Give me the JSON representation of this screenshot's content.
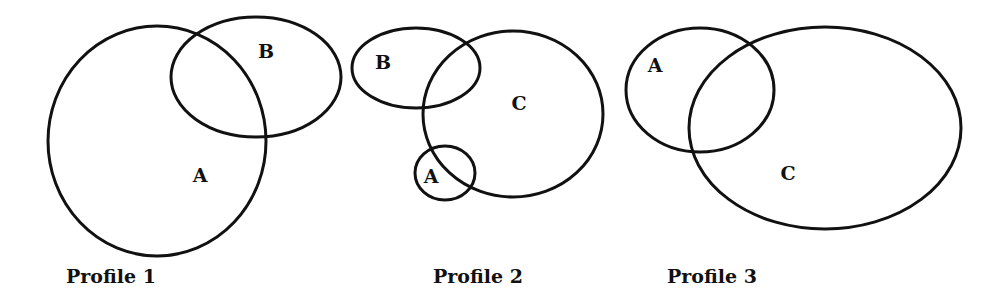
{
  "diagram": {
    "type": "euler-diagram",
    "stroke_color": "#111111",
    "background": "#ffffff",
    "profiles": [
      {
        "caption": "Profile 1",
        "caption_pos": {
          "x": 66,
          "y": 283
        },
        "sets": [
          {
            "label": "A",
            "cx": 157,
            "cy": 141,
            "rx": 109,
            "ry": 115,
            "label_pos": {
              "x": 200,
              "y": 182
            }
          },
          {
            "label": "B",
            "cx": 256,
            "cy": 77,
            "rx": 85,
            "ry": 60,
            "label_pos": {
              "x": 266,
              "y": 58
            }
          }
        ]
      },
      {
        "caption": "Profile 2",
        "caption_pos": {
          "x": 433,
          "y": 283
        },
        "sets": [
          {
            "label": "B",
            "cx": 416,
            "cy": 68,
            "rx": 64,
            "ry": 40,
            "label_pos": {
              "x": 383,
              "y": 69
            }
          },
          {
            "label": "C",
            "cx": 513,
            "cy": 114,
            "rx": 90,
            "ry": 83,
            "label_pos": {
              "x": 519,
              "y": 110
            }
          },
          {
            "label": "A",
            "cx": 445,
            "cy": 173,
            "rx": 30,
            "ry": 27,
            "label_pos": {
              "x": 431,
              "y": 183
            }
          }
        ]
      },
      {
        "caption": "Profile 3",
        "caption_pos": {
          "x": 667,
          "y": 283
        },
        "sets": [
          {
            "label": "A",
            "cx": 700,
            "cy": 90,
            "rx": 74,
            "ry": 62,
            "label_pos": {
              "x": 655,
              "y": 72
            }
          },
          {
            "label": "C",
            "cx": 825,
            "cy": 128,
            "rx": 136,
            "ry": 101,
            "label_pos": {
              "x": 788,
              "y": 180
            }
          }
        ]
      }
    ]
  }
}
